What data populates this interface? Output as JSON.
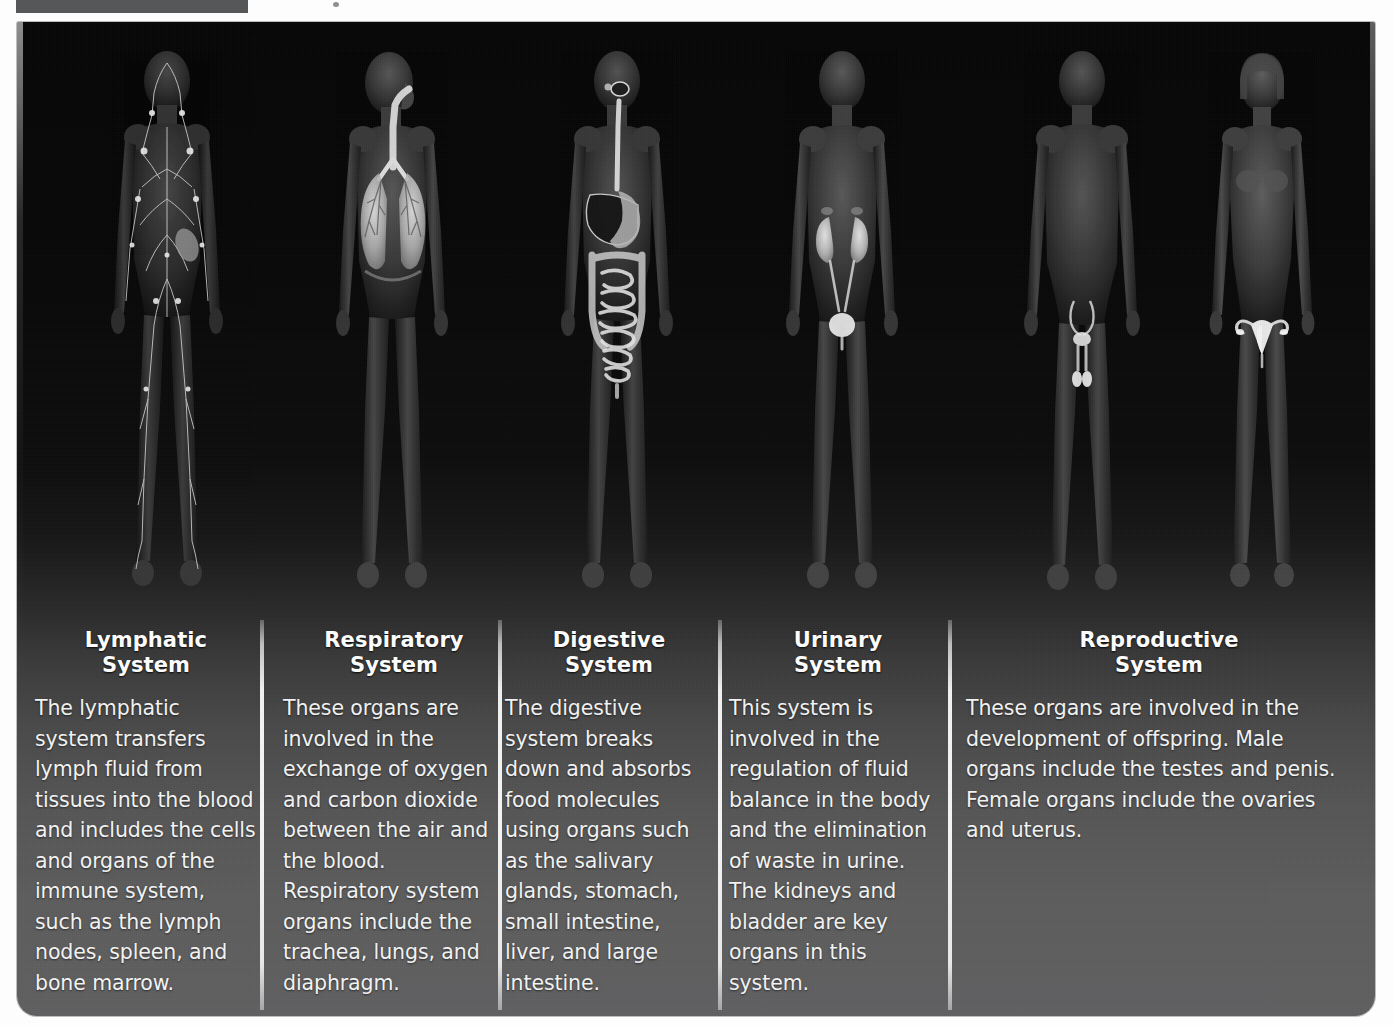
{
  "figure": {
    "background_top_color": "#070707",
    "background_bottom_color": "#606062",
    "divider_color": "#f4f4f4",
    "text_color": "#ffffff"
  },
  "bodies": [
    {
      "name": "lymphatic-body",
      "highlight": "lymph-vessels-and-nodes"
    },
    {
      "name": "respiratory-body",
      "highlight": "trachea-and-lungs"
    },
    {
      "name": "digestive-body",
      "highlight": "esophagus-stomach-liver-intestines"
    },
    {
      "name": "urinary-body",
      "highlight": "kidneys-ureters-bladder"
    },
    {
      "name": "male-reproductive-body",
      "highlight": "testes-and-penis"
    },
    {
      "name": "female-reproductive-body",
      "highlight": "ovaries-and-uterus"
    }
  ],
  "columns": [
    {
      "id": "lymphatic",
      "title_line1": "Lymphatic",
      "title_line2": "System",
      "body": "The lymphatic system transfers lymph fluid from tissues into the blood and includes the cells and organs of the immune system, such as the lymph nodes, spleen, and bone marrow."
    },
    {
      "id": "respiratory",
      "title_line1": "Respiratory",
      "title_line2": "System",
      "body": "These organs are involved in the exchange of oxygen and carbon dioxide between the air and the blood. Respiratory system organs include the trachea, lungs, and diaphragm."
    },
    {
      "id": "digestive",
      "title_line1": "Digestive",
      "title_line2": "System",
      "body": "The digestive system breaks down and absorbs food molecules using organs such as the salivary glands, stomach, small intestine, liver, and large intestine."
    },
    {
      "id": "urinary",
      "title_line1": "Urinary",
      "title_line2": "System",
      "body": "This system is involved in the regulation of fluid balance in the body and the elimination of waste in urine. The kidneys and bladder are key organs in this system."
    },
    {
      "id": "reproductive",
      "title_line1": "Reproductive",
      "title_line2": "System",
      "body": "These organs are involved in the development of offspring. Male organs include the testes and penis. Female organs include the ovaries and uterus."
    }
  ]
}
